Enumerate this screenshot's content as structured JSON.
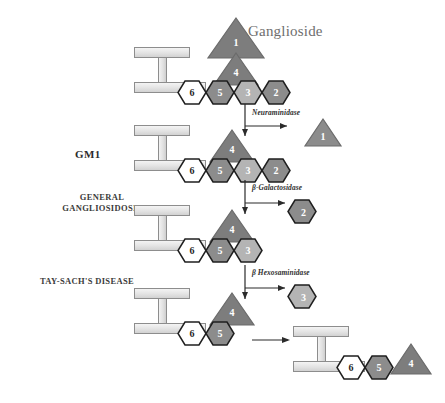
{
  "diagram": {
    "title_label": "Ganglioside",
    "palette": {
      "dark_gray": "#7d7d7d",
      "mid_gray": "#9a9a9a",
      "light_gray": "#c9c9c9",
      "white": "#ffffff",
      "outline": "#1f1f1f",
      "ceramide_fill": "#e6e6e6",
      "ceramide_stroke": "#8d8d8d",
      "text_gray": "#6e6e6e",
      "arrow": "#2b2b2b"
    },
    "side_labels": [
      {
        "id": "gm1",
        "text": "GM1"
      },
      {
        "id": "general-gangliosidosis",
        "line1": "GENERAL",
        "line2": "GANGLIOSIDOSIS"
      },
      {
        "id": "tay-sachs",
        "text": "TAY-SACH'S DISEASE"
      }
    ],
    "enzymes": [
      {
        "id": "neuraminidase",
        "label": "Neuraminidase"
      },
      {
        "id": "beta-galactosidase",
        "label": "β-Galactosidase"
      },
      {
        "id": "beta-hexosaminidase",
        "label": "β Hexosaminidase"
      }
    ],
    "rows": [
      {
        "id": "row-ganglioside",
        "name": "Ganglioside",
        "hexagons": [
          {
            "label": "6",
            "shade": "white"
          },
          {
            "label": "5",
            "shade": "dark"
          },
          {
            "label": "3",
            "shade": "light"
          },
          {
            "label": "2",
            "shade": "dark"
          }
        ],
        "triangles": [
          {
            "label": "4",
            "shade": "dark",
            "position": "stacked-lower"
          },
          {
            "label": "1",
            "shade": "dark",
            "position": "stacked-upper"
          }
        ]
      },
      {
        "id": "row-gm1",
        "name": "GM1",
        "hexagons": [
          {
            "label": "6",
            "shade": "white"
          },
          {
            "label": "5",
            "shade": "dark"
          },
          {
            "label": "3",
            "shade": "light"
          },
          {
            "label": "2",
            "shade": "dark"
          }
        ],
        "triangles": [
          {
            "label": "4",
            "shade": "dark",
            "position": "on-hex-5"
          }
        ]
      },
      {
        "id": "row-gm2",
        "name": "GM2",
        "hexagons": [
          {
            "label": "6",
            "shade": "white"
          },
          {
            "label": "5",
            "shade": "dark"
          },
          {
            "label": "3",
            "shade": "light"
          }
        ],
        "triangles": [
          {
            "label": "4",
            "shade": "dark",
            "position": "on-hex-5"
          }
        ]
      },
      {
        "id": "row-gm3",
        "name": "GM3",
        "hexagons": [
          {
            "label": "6",
            "shade": "white"
          },
          {
            "label": "5",
            "shade": "dark"
          }
        ],
        "triangles": [
          {
            "label": "4",
            "shade": "dark",
            "position": "on-hex-5"
          }
        ]
      },
      {
        "id": "row-final",
        "name": "Final product",
        "hexagons": [
          {
            "label": "6",
            "shade": "white"
          },
          {
            "label": "5",
            "shade": "dark"
          }
        ],
        "triangles": [
          {
            "label": "4",
            "shade": "dark",
            "position": "right-of-chain"
          }
        ]
      }
    ],
    "released_products": [
      {
        "id": "product-1",
        "shape": "triangle",
        "label": "1",
        "shade": "dark"
      },
      {
        "id": "product-2",
        "shape": "hexagon",
        "label": "2",
        "shade": "dark"
      },
      {
        "id": "product-3",
        "shape": "hexagon",
        "label": "3",
        "shade": "light"
      }
    ]
  }
}
